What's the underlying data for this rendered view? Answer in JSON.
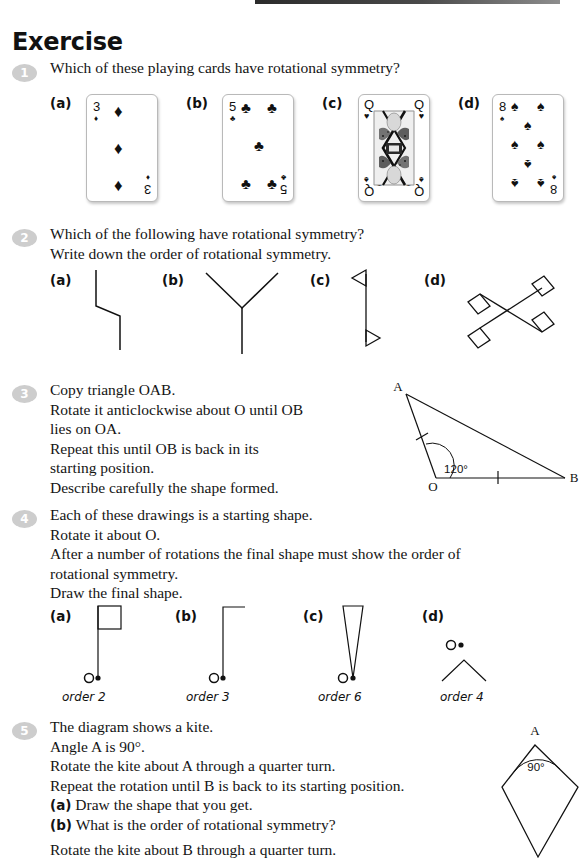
{
  "page": {
    "title": "Exercise",
    "top_rule_color": "#2b2b2b",
    "bullet_color": "#cdcdcd"
  },
  "questions": [
    {
      "number": "1",
      "lines": [
        "Which of these playing cards have rotational symmetry?"
      ],
      "parts": [
        {
          "label": "(a)",
          "card": {
            "rank": "3",
            "suit": "diamond",
            "suit_glyph": "♦",
            "pip_count": 3
          }
        },
        {
          "label": "(b)",
          "card": {
            "rank": "5",
            "suit": "club",
            "suit_glyph": "♣",
            "pip_count": 5
          }
        },
        {
          "label": "(c)",
          "card": {
            "rank": "Q",
            "suit": "heart",
            "suit_glyph": "♥",
            "corner_bottom_suit_glyph": "♠",
            "pip_count": 0
          }
        },
        {
          "label": "(d)",
          "card": {
            "rank": "8",
            "suit": "spade",
            "suit_glyph": "♠",
            "pip_count": 8
          }
        }
      ]
    },
    {
      "number": "2",
      "lines": [
        "Which of the following have rotational symmetry?",
        "Write down the order of rotational symmetry."
      ],
      "parts": [
        {
          "label": "(a)",
          "shape": "zigzag-line"
        },
        {
          "label": "(b)",
          "shape": "y-shape"
        },
        {
          "label": "(c)",
          "shape": "double-arrowhead-line"
        },
        {
          "label": "(d)",
          "shape": "cross-with-diamonds"
        }
      ]
    },
    {
      "number": "3",
      "lines": [
        "Copy triangle OAB.",
        "Rotate it anticlockwise about O until OB",
        "lies on OA.",
        "Repeat this until OB is back in its",
        "starting position.",
        "Describe carefully the shape formed."
      ],
      "diagram": {
        "vertices": [
          "A",
          "O",
          "B"
        ],
        "angle_label": "120°",
        "tick_marks": 2
      }
    },
    {
      "number": "4",
      "lines": [
        "Each of these drawings is a starting shape.",
        "Rotate it about O.",
        "After a number of rotations the final shape must show the order of",
        "rotational symmetry.",
        "Draw the final shape."
      ],
      "parts": [
        {
          "label": "(a)",
          "shape": "flag-square",
          "caption": "order 2",
          "centre_label": "O"
        },
        {
          "label": "(b)",
          "shape": "flag-bent",
          "caption": "order 3",
          "centre_label": "O"
        },
        {
          "label": "(c)",
          "shape": "narrow-triangle",
          "caption": "order 6",
          "centre_label": "O"
        },
        {
          "label": "(d)",
          "shape": "chevron",
          "caption": "order 4",
          "centre_label": "O"
        }
      ]
    },
    {
      "number": "5",
      "lines": [
        "The diagram shows a kite.",
        "Angle A is 90°.",
        "Rotate the kite about A through a quarter turn.",
        "Repeat the rotation until B is back to its starting position."
      ],
      "subparts": [
        {
          "label": "(a)",
          "text": "Draw the shape that you get."
        },
        {
          "label": "(b)",
          "text": "What is the order of rotational symmetry?"
        }
      ],
      "trailing_line": "Rotate the kite about B through a quarter turn.",
      "diagram": {
        "apex_label": "A",
        "angle_label": "90°"
      }
    }
  ]
}
